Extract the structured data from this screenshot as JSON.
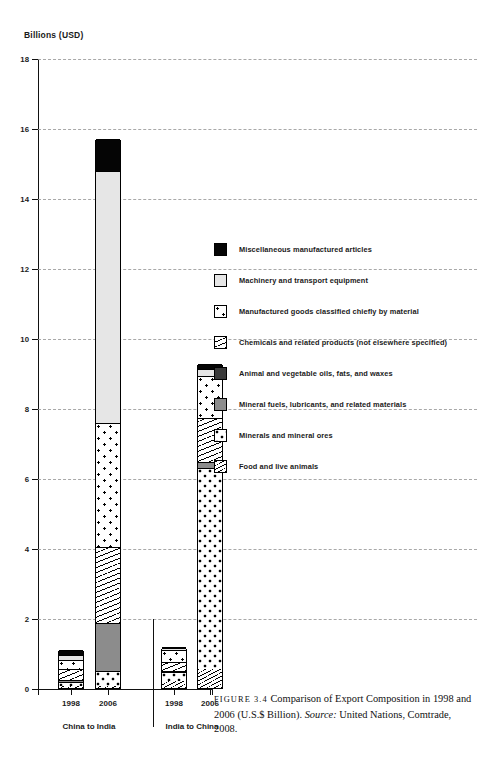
{
  "axis": {
    "y_title": "Billions (USD)",
    "y_ticks": [
      "18",
      "16",
      "14",
      "12",
      "10",
      "8",
      "6",
      "4",
      "2",
      "0"
    ]
  },
  "groups": [
    {
      "name": "China to India",
      "label": "China to India"
    },
    {
      "name": "India to China",
      "label": "India to China"
    }
  ],
  "categories": [
    "1998",
    "2006",
    "1998",
    "2006"
  ],
  "legend": {
    "items": [
      {
        "label": "Miscellaneous manufactured articles",
        "pattern": "solid-black",
        "color": "#050505",
        "icon": "swatch-solid-black"
      },
      {
        "label": "Machinery and transport equipment",
        "pattern": "solid-light-gray",
        "color": "#e6e6e6",
        "icon": "swatch-light-gray"
      },
      {
        "label": "Manufactured goods classified chiefly by material",
        "pattern": "star-dots",
        "color": "#ffffff",
        "icon": "swatch-star-dots"
      },
      {
        "label": "Chemicals and related products (not elsewhere specified)",
        "pattern": "wavy-lines",
        "color": "#ffffff",
        "icon": "swatch-wavy-lines"
      },
      {
        "label": "Animal and vegetable oils, fats, and waxes",
        "pattern": "solid-dark-gray",
        "color": "#3a3a3a",
        "icon": "swatch-dark-gray"
      },
      {
        "label": "Mineral fuels, lubricants, and related materials",
        "pattern": "solid-mid-gray",
        "color": "#8c8c8c",
        "icon": "swatch-mid-gray"
      },
      {
        "label": "Minerals and mineral ores",
        "pattern": "large-dots",
        "color": "#ffffff",
        "icon": "swatch-large-dots"
      },
      {
        "label": "Food and live animals",
        "pattern": "fine-hatch",
        "color": "#ffffff",
        "icon": "swatch-fine-hatch"
      }
    ]
  },
  "caption": {
    "figure_tag": "FIGURE 3.4",
    "title": "Comparison of Export Composition in 1998 and 2006 (U.S.$ Billion).",
    "source_label": "Source",
    "source_text": "United Nations, Comtrade, 2008."
  },
  "chart_data": {
    "type": "bar",
    "title": "Comparison of Export Composition in 1998 and 2006 (U.S.$ Billion)",
    "xlabel": "",
    "ylabel": "Billions (USD)",
    "ylim": [
      0,
      18
    ],
    "ytick_step": 2,
    "grid": true,
    "stacked": true,
    "legend_position": "right",
    "categories": [
      "China to India 1998",
      "China to India 2006",
      "India to China 1998",
      "India to China 2006"
    ],
    "group_labels": [
      "China to India",
      "India to China"
    ],
    "series": [
      {
        "name": "Food and live animals",
        "values": [
          0.05,
          0.05,
          0.2,
          0.55
        ]
      },
      {
        "name": "Minerals and mineral ores",
        "values": [
          0.12,
          0.45,
          0.25,
          5.75
        ]
      },
      {
        "name": "Mineral fuels, lubricants, and related materials",
        "values": [
          0.05,
          1.35,
          0.02,
          0.15
        ]
      },
      {
        "name": "Animal and vegetable oils, fats, and waxes",
        "values": [
          0.02,
          0.02,
          0.02,
          0.02
        ]
      },
      {
        "name": "Chemicals and related products (not elsewhere specified)",
        "values": [
          0.3,
          2.15,
          0.25,
          1.25
        ]
      },
      {
        "name": "Manufactured goods classified chiefly by material",
        "values": [
          0.25,
          3.55,
          0.35,
          1.2
        ]
      },
      {
        "name": "Machinery and transport equipment",
        "values": [
          0.16,
          7.2,
          0.04,
          0.2
        ]
      },
      {
        "name": "Miscellaneous manufactured articles",
        "values": [
          0.15,
          0.93,
          0.02,
          0.13
        ]
      }
    ],
    "totals": [
      1.1,
      15.7,
      1.15,
      9.25
    ]
  }
}
